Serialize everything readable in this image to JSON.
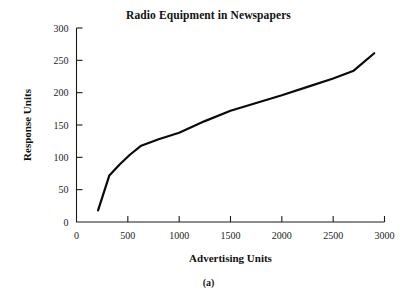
{
  "figure": {
    "caption": "(a)"
  },
  "chart_data": {
    "type": "line",
    "title": "Radio Equipment in Newspapers",
    "xlabel": "Advertising Units",
    "ylabel": "Response Units",
    "xlim": [
      0,
      3000
    ],
    "ylim": [
      0,
      300
    ],
    "xticks": [
      0,
      500,
      1000,
      1500,
      2000,
      2500,
      3000
    ],
    "yticks": [
      0,
      50,
      100,
      150,
      200,
      250,
      300
    ],
    "xtick_labels": [
      "0",
      "500",
      "1000",
      "1500",
      "2000",
      "2500",
      "3000"
    ],
    "ytick_labels": [
      "0",
      "50",
      "100",
      "150",
      "200",
      "250",
      "300"
    ],
    "grid": false,
    "legend": false,
    "line_color": "#0a0a0a",
    "series": [
      {
        "name": "Response",
        "x": [
          210,
          320,
          420,
          520,
          630,
          800,
          1000,
          1250,
          1500,
          1750,
          2000,
          2250,
          2500,
          2700,
          2900
        ],
        "y": [
          18,
          72,
          89,
          104,
          118,
          128,
          138,
          156,
          172,
          184,
          196,
          209,
          222,
          234,
          261
        ]
      }
    ]
  }
}
